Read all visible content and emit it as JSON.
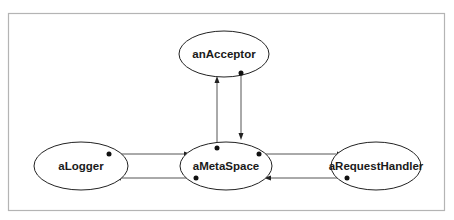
{
  "diagram": {
    "type": "object-collaboration",
    "nodes": [
      {
        "id": "anAcceptor",
        "label": "anAcceptor"
      },
      {
        "id": "aLogger",
        "label": "aLogger"
      },
      {
        "id": "aMetaSpace",
        "label": "aMetaSpace"
      },
      {
        "id": "aRequestHandler",
        "label": "aRequestHandler"
      }
    ],
    "edges": [
      {
        "from": "aMetaSpace",
        "to": "anAcceptor"
      },
      {
        "from": "anAcceptor",
        "to": "aMetaSpace"
      },
      {
        "from": "aLogger",
        "to": "aMetaSpace"
      },
      {
        "from": "aMetaSpace",
        "to": "aLogger"
      },
      {
        "from": "aMetaSpace",
        "to": "aRequestHandler"
      },
      {
        "from": "aRequestHandler",
        "to": "aMetaSpace"
      }
    ]
  }
}
